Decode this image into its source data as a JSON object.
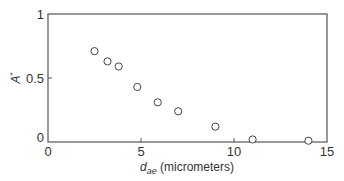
{
  "chart_data": {
    "type": "scatter",
    "title": "",
    "xlabel": "d_ae (micrometers)",
    "xlabel_parts": {
      "main": "d",
      "sub": "ae",
      "rest": " (micrometers)"
    },
    "ylabel": "A*",
    "ylabel_parts": {
      "main": "A",
      "sup": "*"
    },
    "xlim": [
      0,
      15
    ],
    "ylim": [
      0,
      1
    ],
    "xticks": [
      0,
      5,
      10,
      15
    ],
    "yticks": [
      0,
      0.5,
      1
    ],
    "xtick_labels": [
      "0",
      "5",
      "10",
      "15"
    ],
    "ytick_labels": [
      "0",
      "0.5",
      "1"
    ],
    "grid": false,
    "legend": null,
    "marker": "open-circle",
    "series": [
      {
        "name": "A*",
        "x": [
          2.5,
          3.2,
          3.8,
          4.8,
          5.9,
          7.0,
          9.0,
          11.0,
          14.0
        ],
        "y": [
          0.71,
          0.63,
          0.59,
          0.43,
          0.31,
          0.24,
          0.12,
          0.02,
          0.01
        ]
      }
    ]
  }
}
